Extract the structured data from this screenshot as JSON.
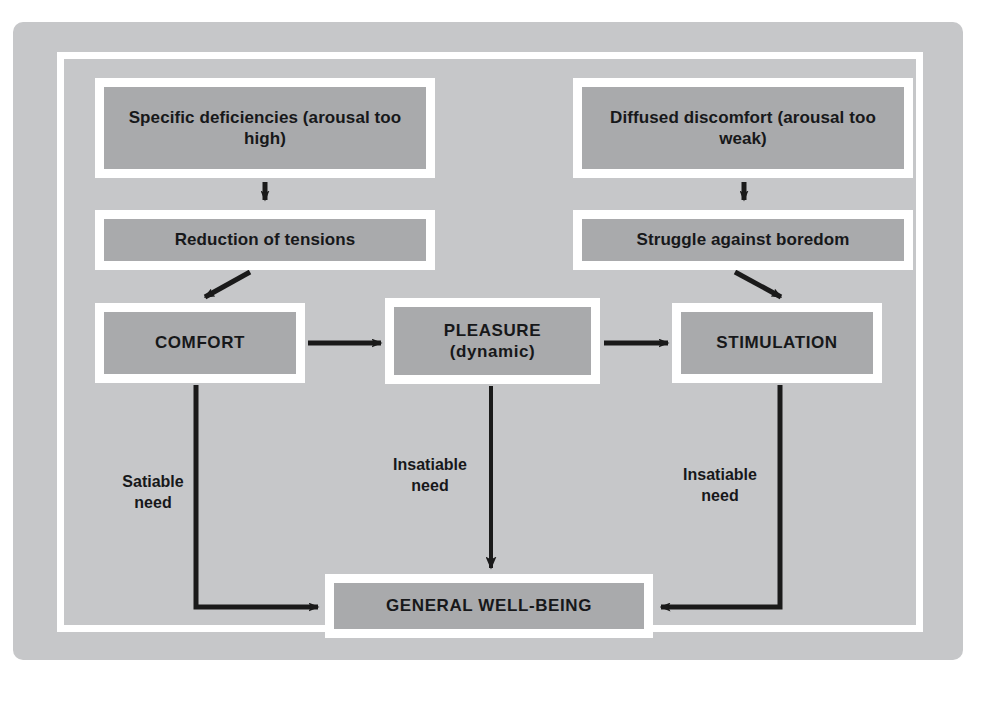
{
  "figure": {
    "panel_color": "#c6c7c9",
    "box_fill_color": "#a9aaac",
    "box_border_color": "#ffffff",
    "text_color": "#17181a",
    "connector_color": "#1a1a1a"
  },
  "boxes": {
    "specific_deficiencies": "Specific deficiencies (arousal too high)",
    "diffused_discomfort": "Diffused discomfort (arousal too weak)",
    "reduction_of_tensions": "Reduction of tensions",
    "struggle_against_boredom": "Struggle against boredom",
    "comfort": "COMFORT",
    "pleasure": "PLEASURE (dynamic)",
    "stimulation": "STIMULATION",
    "general_wellbeing": "GENERAL WELL-BEING"
  },
  "edge_labels": {
    "satiable_need": "Satiable\nneed",
    "insatiable_need_middle": "Insatiable\nneed",
    "insatiable_need_right": "Insatiable\nneed"
  },
  "caption_ghost": "",
  "connectors": [
    {
      "name": "specific-to-reduction",
      "from": "specific_deficiencies",
      "to": "reduction_of_tensions",
      "style": "vertical-arrow"
    },
    {
      "name": "diffused-to-struggle",
      "from": "diffused_discomfort",
      "to": "struggle_against_boredom",
      "style": "vertical-arrow"
    },
    {
      "name": "reduction-to-comfort",
      "from": "reduction_of_tensions",
      "to": "comfort",
      "style": "diagonal-arrow-down-left"
    },
    {
      "name": "struggle-to-stimulation",
      "from": "struggle_against_boredom",
      "to": "stimulation",
      "style": "diagonal-arrow-down-right"
    },
    {
      "name": "comfort-to-pleasure",
      "from": "comfort",
      "to": "pleasure",
      "style": "horizontal-arrow-right"
    },
    {
      "name": "pleasure-to-stimulation",
      "from": "pleasure",
      "to": "stimulation",
      "style": "horizontal-arrow-right"
    },
    {
      "name": "comfort-to-wellbeing",
      "from": "comfort",
      "to": "general_wellbeing",
      "style": "elbow-arrow-right",
      "label": "satiable_need"
    },
    {
      "name": "pleasure-to-wellbeing",
      "from": "pleasure",
      "to": "general_wellbeing",
      "style": "vertical-arrow",
      "label": "insatiable_need_middle"
    },
    {
      "name": "stimulation-to-wellbeing",
      "from": "stimulation",
      "to": "general_wellbeing",
      "style": "elbow-arrow-left",
      "label": "insatiable_need_right"
    }
  ]
}
